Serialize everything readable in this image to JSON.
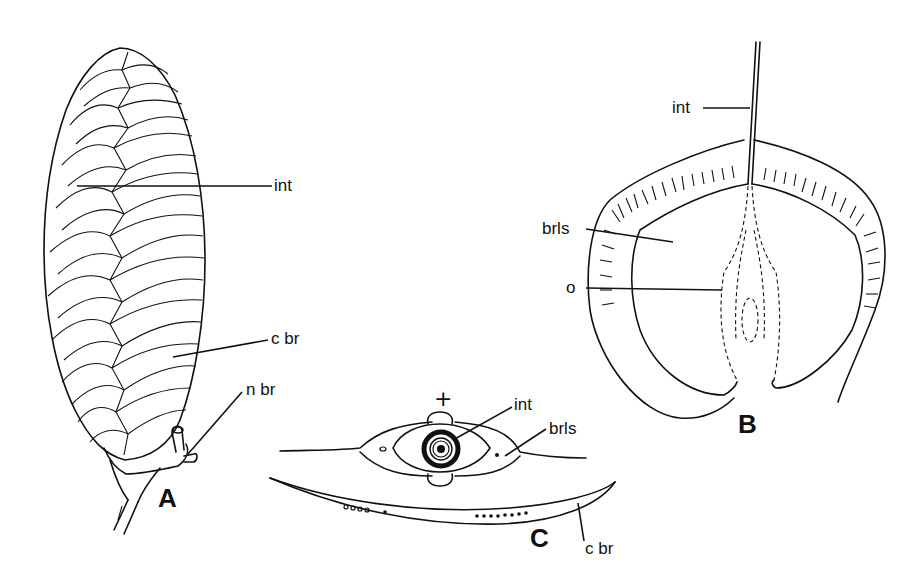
{
  "figure": {
    "panels": [
      {
        "id": "A",
        "letter": "A",
        "description": "Seed cone (strobilus) with imbricate bracts and stalk",
        "labels": {
          "int": "int",
          "c_br": "c br",
          "n_br": "n br"
        }
      },
      {
        "id": "B",
        "letter": "B",
        "description": "Longitudinal section of bract-scale with integument and ovule",
        "labels": {
          "int": "int",
          "brls": "brls",
          "o": "o"
        }
      },
      {
        "id": "C",
        "letter": "C",
        "description": "Transverse section of bracteole and cone bract",
        "labels": {
          "plus": "+",
          "int": "int",
          "brls": "brls",
          "c_br": "c br"
        }
      }
    ]
  },
  "colors": {
    "ink": "#111111",
    "background": "#ffffff"
  }
}
